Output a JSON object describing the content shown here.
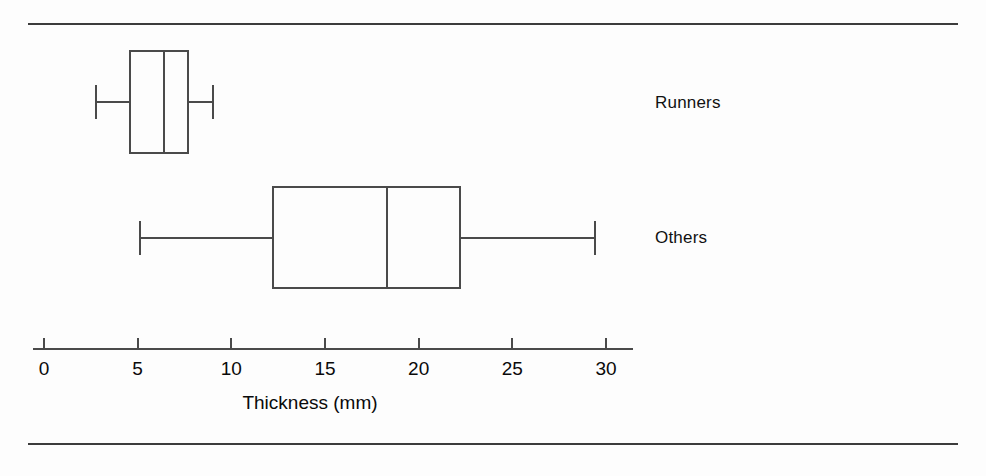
{
  "figure": {
    "background_color": "#fdfdfd",
    "line_color": "#4a4a4a",
    "rule_color": "#3c3c3c"
  },
  "chart_data": {
    "type": "box",
    "orientation": "horizontal",
    "title": "",
    "xlabel": "Thickness (mm)",
    "ylabel": "",
    "xlim": [
      0,
      31.5
    ],
    "grid": false,
    "legend": "none",
    "xticks": [
      0,
      5,
      10,
      15,
      20,
      25,
      30
    ],
    "xticklabels": [
      "0",
      "5",
      "10",
      "15",
      "20",
      "25",
      "30"
    ],
    "categories": [
      "Runners",
      "Others"
    ],
    "boxes": [
      {
        "label": "Runners",
        "whisker_low": 2.8,
        "q1": 4.6,
        "median": 6.4,
        "q3": 7.7,
        "whisker_high": 9.0
      },
      {
        "label": "Others",
        "whisker_low": 5.1,
        "q1": 12.2,
        "median": 18.3,
        "q3": 22.2,
        "whisker_high": 29.4
      }
    ]
  },
  "axis": {
    "title": "Thickness (mm)",
    "tick_labels": [
      "0",
      "5",
      "10",
      "15",
      "20",
      "25",
      "30"
    ]
  },
  "labels": {
    "runners": "Runners",
    "others": "Others"
  }
}
